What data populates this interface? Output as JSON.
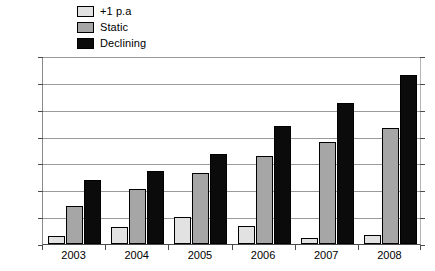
{
  "chart_data": {
    "type": "bar",
    "title": "",
    "xlabel": "",
    "ylabel": "",
    "currency": "£",
    "categories": [
      "2003",
      "2004",
      "2005",
      "2006",
      "2007",
      "2008"
    ],
    "series": [
      {
        "name": "+1 p.a",
        "color": "#e2e2e2",
        "values": [
          282,
          291,
          300,
          292,
          281,
          283
        ]
      },
      {
        "name": "Static",
        "color": "#a6a6a6",
        "values": [
          310,
          326,
          341,
          357,
          370,
          383
        ]
      },
      {
        "name": "Declining",
        "color": "#0b0b0b",
        "values": [
          335,
          343,
          359,
          385,
          406,
          432
        ]
      }
    ],
    "ylim": [
      275,
      450
    ],
    "ytick_step": 25,
    "ytick_labels": [
      "£450",
      "£425",
      "£400",
      "£375",
      "£350",
      "£325",
      "£300",
      "£275"
    ],
    "ytick_values": [
      450,
      425,
      400,
      375,
      350,
      325,
      300,
      275
    ],
    "grid": true,
    "legend_position": "top-left"
  },
  "legend": {
    "entries": [
      {
        "label": "+1 p.a"
      },
      {
        "label": "Static"
      },
      {
        "label": "Declining"
      }
    ]
  }
}
